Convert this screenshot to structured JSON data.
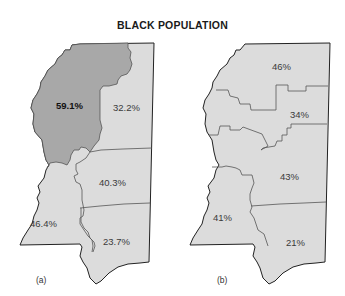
{
  "title": "BLACK POPULATION",
  "colors": {
    "region_light": "#dcdcdc",
    "region_dark": "#a8a8a8",
    "border": "#555555",
    "outline": "#222222"
  },
  "maps": [
    {
      "caption": "(a)",
      "regions": [
        {
          "label": "59.1%",
          "highlighted": true
        },
        {
          "label": "32.2%",
          "highlighted": false
        },
        {
          "label": "40.3%",
          "highlighted": false
        },
        {
          "label": "46.4%",
          "highlighted": false
        },
        {
          "label": "23.7%",
          "highlighted": false
        }
      ]
    },
    {
      "caption": "(b)",
      "regions": [
        {
          "label": "46%"
        },
        {
          "label": "34%"
        },
        {
          "label": "43%"
        },
        {
          "label": "41%"
        },
        {
          "label": "21%"
        }
      ]
    }
  ]
}
